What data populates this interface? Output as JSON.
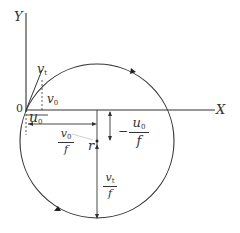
{
  "diagram": {
    "type": "circular trajectory diagram",
    "axes": {
      "x_label": "X",
      "y_label": "Y",
      "origin_label": "0"
    },
    "vectors": {
      "v_t": {
        "symbol": "v",
        "subscript": "t"
      },
      "v0": {
        "symbol": "v",
        "subscript": "0"
      },
      "u0": {
        "symbol": "u",
        "subscript": "0"
      }
    },
    "dimensions": {
      "horizontal": {
        "num_symbol": "v",
        "num_subscript": "0",
        "den": "f"
      },
      "vertical_upper": {
        "sign": "−",
        "num_symbol": "u",
        "num_subscript": "0",
        "den": "f"
      },
      "vertical_lower": {
        "num_symbol": "v",
        "num_subscript": "t",
        "den": "f"
      },
      "radius_label": "r"
    },
    "circle": {
      "direction": "clockwise",
      "stroke_color": "#333333"
    },
    "colors": {
      "line": "#333333",
      "background": "#ffffff"
    }
  }
}
